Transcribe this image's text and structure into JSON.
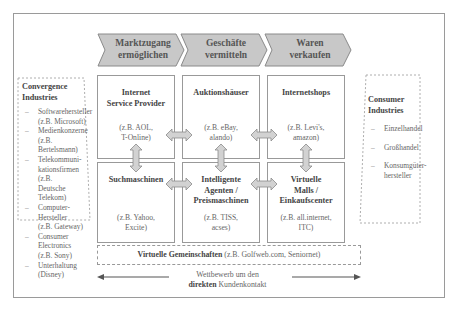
{
  "process_steps": [
    {
      "line1": "Marktzugang",
      "line2": "ermöglichen"
    },
    {
      "line1": "Geschäfte",
      "line2": "vermitteln"
    },
    {
      "line1": "Waren",
      "line2": "verkaufen"
    }
  ],
  "cells": [
    {
      "title": "Internet Service Provider",
      "title_lines": [
        "Internet",
        "Service Provider"
      ],
      "example_lines": [
        "(z.B. AOL,",
        "T-Online)"
      ]
    },
    {
      "title": "Auktionshäuser",
      "title_lines": [
        "Auktionshäuser"
      ],
      "example_lines": [
        "(z.B. eBay,",
        "alando)"
      ]
    },
    {
      "title": "Internetshops",
      "title_lines": [
        "Internetshops"
      ],
      "example_lines": [
        "(z.B. Levi's,",
        "amazon)"
      ]
    },
    {
      "title": "Suchmaschinen",
      "title_lines": [
        "Suchmaschinen"
      ],
      "example_lines": [
        "(z.B. Yahoo,",
        "Excite)"
      ]
    },
    {
      "title": "Intelligente Agenten / Preismaschinen",
      "title_lines": [
        "Intelligente",
        "Agenten /",
        "Preismaschinen"
      ],
      "example_lines": [
        "(z.B. TISS,",
        "acses)"
      ]
    },
    {
      "title": "Virtuelle Malls / Einkaufscenter",
      "title_lines": [
        "Virtuelle",
        "Malls /",
        "Einkaufscenter"
      ],
      "example_lines": [
        "(z.B. all.internet,",
        "ITC)"
      ]
    }
  ],
  "convergence": {
    "title_lines": [
      "Convergence",
      "Industries"
    ],
    "items": [
      {
        "lines": [
          "Softwarehersteller",
          "(z.B. Microsoft)"
        ]
      },
      {
        "lines": [
          "Medienkonzerne (z.B.",
          "Bertelsmann)"
        ]
      },
      {
        "lines": [
          "Telekommuni-",
          "kationsfirmen (z.B.",
          "Deutsche Telekom)"
        ]
      },
      {
        "lines": [
          "Computer-",
          "Hersteller",
          "(z.B. Gateway)"
        ]
      },
      {
        "lines": [
          "Consumer",
          "Electronics",
          "(z.B. Sony)"
        ]
      },
      {
        "lines": [
          "Unterhaltung",
          "(Disney)"
        ]
      }
    ]
  },
  "consumer": {
    "title_lines": [
      "Consumer",
      "Industries"
    ],
    "items": [
      {
        "lines": [
          "Einzelhandel"
        ]
      },
      {
        "lines": [
          "Großhandel"
        ]
      },
      {
        "lines": [
          "Konsumgüter-",
          "hersteller"
        ]
      }
    ]
  },
  "virtual_communities": {
    "bold": "Virtuelle Gemeinschaften",
    "rest": " (z.B. Golfweb.com, Seniornet)"
  },
  "competition": {
    "line1": "Wettbewerb um den",
    "bold": "direkten",
    "rest": " Kundenkontakt"
  },
  "colors": {
    "chevron_fill": "#c8c8c8",
    "chevron_stroke": "#8a8a8a",
    "arrow_fill": "#d2d2d2",
    "border": "#999999"
  }
}
